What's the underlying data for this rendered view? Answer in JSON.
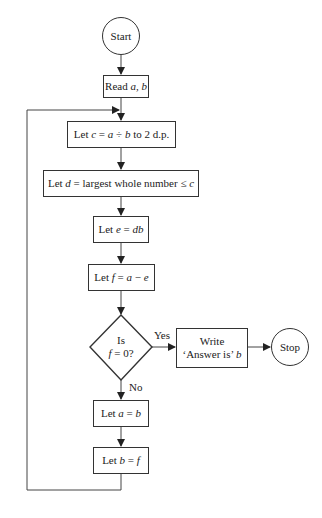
{
  "flowchart": {
    "start": "Start",
    "read": {
      "prefix": "Read ",
      "vars": "a, b"
    },
    "step_c": {
      "prefix": "Let ",
      "var": "c",
      "expr": " = ",
      "a": "a",
      "op": " ÷ ",
      "b": "b",
      "suffix": " to 2 d.p."
    },
    "step_d": {
      "prefix": "Let ",
      "var": "d",
      "expr": " = largest whole number ≤ ",
      "c": "c"
    },
    "step_e": {
      "prefix": "Let ",
      "var": "e",
      "expr": " = ",
      "rhs": "db"
    },
    "step_f": {
      "prefix": "Let ",
      "var": "f",
      "expr": " = ",
      "a": "a",
      "op": " − ",
      "e": "e"
    },
    "decision": {
      "line1": "Is",
      "var": "f",
      "line2_rest": " = 0?"
    },
    "yes_label": "Yes",
    "no_label": "No",
    "write": {
      "line1": "Write",
      "line2": "‘Answer is’ ",
      "var": "b"
    },
    "stop": "Stop",
    "step_a": {
      "prefix": "Let ",
      "var": "a",
      "expr": " = ",
      "rhs": "b"
    },
    "step_b": {
      "prefix": "Let ",
      "var": "b",
      "expr": " = ",
      "rhs": "f"
    }
  }
}
